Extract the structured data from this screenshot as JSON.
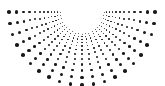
{
  "figure": {
    "name": "radial-dot-burst",
    "width": 165,
    "height": 86,
    "background_color": "#ffffff",
    "dot_color": "#1a1a1a"
  },
  "chart_data": {
    "type": "scatter",
    "subtitle": "",
    "xlabel": "",
    "ylabel": "",
    "xlim": [
      0,
      165
    ],
    "ylim": [
      0,
      86
    ],
    "grid": false,
    "legend": "none",
    "annotations": [],
    "geometry": {
      "pattern": "radial-sunburst",
      "center_x": 82,
      "center_y": 12,
      "angle_start_deg": 180,
      "angle_end_deg": 0,
      "ray_count": 21,
      "angle_step_deg": 9,
      "dots_per_ray": 12,
      "radius_min": 9,
      "radius_max": 73,
      "radius_growth": 1.115,
      "dot_size_min": 0.9,
      "dot_size_max": 3.5,
      "dot_size_growth": 1.135
    },
    "ray_angles_deg": [
      180,
      171,
      162,
      153,
      144,
      135,
      126,
      117,
      108,
      99,
      90,
      81,
      72,
      63,
      54,
      45,
      36,
      27,
      18,
      9,
      0
    ],
    "ray_radii": [
      9.0,
      10.0,
      11.2,
      12.5,
      13.9,
      15.5,
      17.3,
      19.3,
      21.5,
      24.0,
      26.7,
      29.8,
      33.2,
      37.0,
      41.3,
      46.0,
      51.3,
      57.2,
      63.8,
      71.1
    ],
    "dot_radii_px": [
      0.45,
      0.51,
      0.58,
      0.66,
      0.75,
      0.85,
      0.97,
      1.1,
      1.24,
      1.41,
      1.6,
      1.82,
      2.06,
      2.34,
      2.66,
      3.02,
      3.42
    ],
    "series": [
      {
        "name": "burst-dots",
        "color": "#1a1a1a",
        "marker": "circle",
        "count": 252
      }
    ]
  }
}
